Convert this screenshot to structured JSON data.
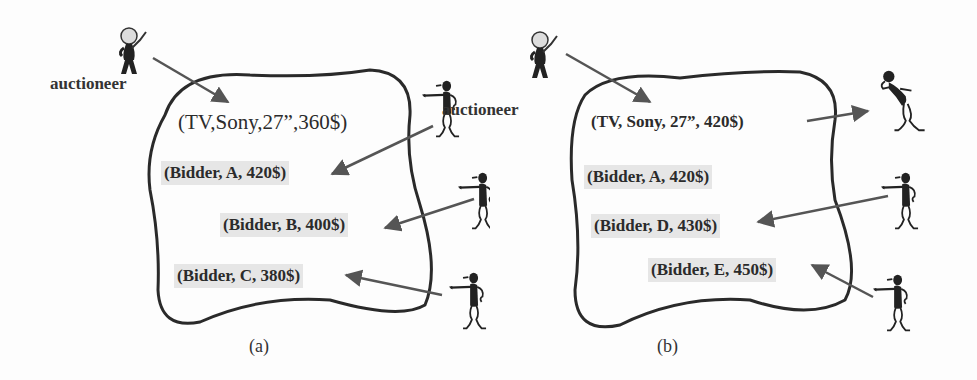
{
  "panels": {
    "a": {
      "caption": "(a)",
      "auctioneer_label": "auctioneer",
      "item": "(TV,Sony,27”,360$)",
      "bids": [
        "(Bidder, A, 420$)",
        "(Bidder, B, 400$)",
        "(Bidder, C, 380$)"
      ]
    },
    "b": {
      "caption": "(b)",
      "auctioneer_label": "auctioneer",
      "item": "(TV, Sony, 27”, 420$)",
      "bids": [
        "(Bidder, A, 420$)",
        "(Bidder, D, 430$)",
        "(Bidder, E, 450$)"
      ]
    }
  },
  "icons": {
    "auctioneer": "auctioneer-figure-icon",
    "bidder": "pointing-bidder-figure-icon",
    "winner": "winner-bidder-figure-icon"
  },
  "colors": {
    "line": "#2a2a2a",
    "arrow": "#555555",
    "label_bg": "#e6e6e6"
  }
}
